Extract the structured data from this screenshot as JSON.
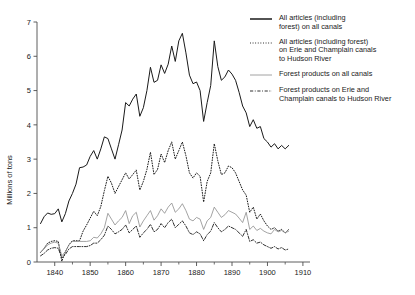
{
  "chart_data": {
    "type": "line",
    "title": "",
    "xlabel": "",
    "ylabel": "Millions of tons",
    "xlim": [
      1835,
      1912
    ],
    "ylim": [
      0,
      7
    ],
    "xticks": [
      1840,
      1850,
      1860,
      1870,
      1880,
      1890,
      1900,
      1910
    ],
    "xticklabels": [
      "1840",
      "1850",
      "1860",
      "1870",
      "1880",
      "1890",
      "1900",
      "1910"
    ],
    "xminorticks": [
      1845,
      1855,
      1865,
      1875,
      1885,
      1895,
      1905
    ],
    "yticks": [
      0,
      1,
      2,
      3,
      4,
      5,
      6,
      7
    ],
    "yticklabels": [
      "0",
      "1",
      "2",
      "3",
      "4",
      "5",
      "6",
      "7"
    ],
    "grid": false,
    "legend_position": "right",
    "axes_style": "left-and-bottom-spines-only",
    "series": [
      {
        "name": "All articles (including\nforest) on all canals",
        "legend_label": "All articles (including\nforest) on all canals",
        "style": "solid",
        "color": "#1a1a1a",
        "width": 1.0,
        "x": [
          1836,
          1837,
          1838,
          1839,
          1840,
          1841,
          1842,
          1843,
          1844,
          1845,
          1846,
          1847,
          1848,
          1849,
          1850,
          1851,
          1852,
          1853,
          1854,
          1855,
          1856,
          1857,
          1858,
          1859,
          1860,
          1861,
          1862,
          1863,
          1864,
          1865,
          1866,
          1867,
          1868,
          1869,
          1870,
          1871,
          1872,
          1873,
          1874,
          1875,
          1876,
          1877,
          1878,
          1879,
          1880,
          1881,
          1882,
          1883,
          1884,
          1885,
          1886,
          1887,
          1888,
          1889,
          1890,
          1891,
          1892,
          1893,
          1894,
          1895,
          1896,
          1897,
          1898,
          1899,
          1900,
          1901,
          1902,
          1903,
          1904,
          1905,
          1906
        ],
        "y": [
          1.12,
          1.32,
          1.43,
          1.39,
          1.41,
          1.55,
          1.17,
          1.41,
          1.78,
          2.0,
          2.27,
          2.75,
          2.77,
          2.83,
          3.08,
          3.25,
          3.0,
          3.3,
          3.65,
          3.6,
          3.3,
          3.0,
          3.42,
          3.85,
          4.65,
          4.55,
          4.75,
          4.9,
          4.25,
          4.5,
          5.0,
          5.68,
          5.24,
          5.3,
          5.75,
          5.5,
          5.77,
          6.3,
          5.85,
          6.45,
          6.67,
          6.1,
          5.45,
          5.2,
          5.25,
          5.0,
          4.1,
          4.65,
          5.15,
          6.45,
          5.7,
          5.3,
          5.4,
          5.6,
          5.48,
          5.3,
          4.95,
          4.55,
          4.35,
          3.95,
          4.15,
          3.9,
          3.95,
          3.6,
          3.5,
          3.35,
          3.45,
          3.3,
          3.4,
          3.3,
          3.4
        ]
      },
      {
        "name": "All articles (including forest)\non Erie and Champlain canals\nto Hudson River",
        "legend_label": "All articles (including forest)\non Erie and Champlain canals\nto Hudson River",
        "style": "dotted",
        "color": "#1a1a1a",
        "width": 1.0,
        "x": [
          1836,
          1837,
          1838,
          1839,
          1840,
          1841,
          1842,
          1843,
          1844,
          1845,
          1846,
          1847,
          1848,
          1849,
          1850,
          1851,
          1852,
          1853,
          1854,
          1855,
          1856,
          1857,
          1858,
          1859,
          1860,
          1861,
          1862,
          1863,
          1864,
          1865,
          1866,
          1867,
          1868,
          1869,
          1870,
          1871,
          1872,
          1873,
          1874,
          1875,
          1876,
          1877,
          1878,
          1879,
          1880,
          1881,
          1882,
          1883,
          1884,
          1885,
          1886,
          1887,
          1888,
          1889,
          1890,
          1891,
          1892,
          1893,
          1894,
          1895,
          1896,
          1897,
          1898,
          1899,
          1900,
          1901,
          1902,
          1903,
          1904,
          1905,
          1906
        ],
        "y": [
          0.28,
          0.4,
          0.55,
          0.6,
          0.62,
          0.6,
          0.02,
          0.3,
          0.5,
          0.62,
          0.62,
          0.62,
          0.9,
          1.08,
          1.28,
          1.48,
          1.35,
          1.62,
          2.08,
          2.5,
          2.3,
          2.0,
          2.2,
          2.4,
          2.6,
          2.42,
          2.55,
          2.68,
          2.1,
          2.35,
          2.7,
          3.2,
          2.55,
          2.7,
          3.15,
          2.9,
          3.25,
          3.5,
          3.0,
          3.25,
          3.5,
          3.1,
          2.6,
          2.45,
          2.6,
          2.5,
          1.75,
          2.35,
          2.6,
          3.45,
          2.95,
          2.55,
          2.6,
          2.8,
          2.75,
          2.6,
          2.35,
          2.1,
          1.95,
          1.45,
          1.6,
          1.25,
          1.4,
          1.2,
          1.05,
          0.95,
          1.0,
          0.9,
          0.95,
          0.85,
          0.95
        ]
      },
      {
        "name": "Forest products on all canals",
        "legend_label": "Forest products on all canals",
        "style": "solid-thin-gray",
        "color": "#8c8c8c",
        "width": 0.8,
        "x": [
          1836,
          1837,
          1838,
          1839,
          1840,
          1841,
          1842,
          1843,
          1844,
          1845,
          1846,
          1847,
          1848,
          1849,
          1850,
          1851,
          1852,
          1853,
          1854,
          1855,
          1856,
          1857,
          1858,
          1859,
          1860,
          1861,
          1862,
          1863,
          1864,
          1865,
          1866,
          1867,
          1868,
          1869,
          1870,
          1871,
          1872,
          1873,
          1874,
          1875,
          1876,
          1877,
          1878,
          1879,
          1880,
          1881,
          1882,
          1883,
          1884,
          1885,
          1886,
          1887,
          1888,
          1889,
          1890,
          1891,
          1892,
          1893,
          1894,
          1895,
          1896,
          1897,
          1898,
          1899,
          1900,
          1901,
          1902,
          1903,
          1904,
          1905,
          1906
        ],
        "y": [
          0.28,
          0.38,
          0.5,
          0.55,
          0.58,
          0.55,
          0.18,
          0.3,
          0.5,
          0.6,
          0.6,
          0.6,
          0.6,
          0.6,
          0.62,
          0.72,
          0.7,
          0.82,
          1.0,
          1.42,
          1.25,
          1.08,
          1.2,
          1.3,
          1.5,
          1.12,
          1.35,
          1.45,
          1.02,
          1.2,
          1.35,
          1.5,
          1.22,
          1.35,
          1.55,
          1.42,
          1.6,
          1.72,
          1.45,
          1.55,
          1.7,
          1.5,
          1.25,
          1.2,
          1.3,
          1.25,
          0.95,
          1.2,
          1.3,
          1.6,
          1.45,
          1.3,
          1.38,
          1.5,
          1.45,
          1.4,
          1.28,
          1.15,
          1.45,
          0.95,
          1.05,
          0.92,
          0.98,
          0.9,
          0.85,
          0.82,
          0.95,
          0.88,
          0.92,
          0.85,
          0.9
        ]
      },
      {
        "name": "Forest products on Erie and\nChamplain canals to Hudson River",
        "legend_label": "Forest products on Erie and\nChamplain canals to Hudson River",
        "style": "dashdot",
        "color": "#1a1a1a",
        "width": 0.9,
        "x": [
          1836,
          1837,
          1838,
          1839,
          1840,
          1841,
          1842,
          1843,
          1844,
          1845,
          1846,
          1847,
          1848,
          1849,
          1850,
          1851,
          1852,
          1853,
          1854,
          1855,
          1856,
          1857,
          1858,
          1859,
          1860,
          1861,
          1862,
          1863,
          1864,
          1865,
          1866,
          1867,
          1868,
          1869,
          1870,
          1871,
          1872,
          1873,
          1874,
          1875,
          1876,
          1877,
          1878,
          1879,
          1880,
          1881,
          1882,
          1883,
          1884,
          1885,
          1886,
          1887,
          1888,
          1889,
          1890,
          1891,
          1892,
          1893,
          1894,
          1895,
          1896,
          1897,
          1898,
          1899,
          1900,
          1901,
          1902,
          1903,
          1904,
          1905,
          1906
        ],
        "y": [
          0.18,
          0.25,
          0.35,
          0.4,
          0.42,
          0.4,
          0.12,
          0.22,
          0.38,
          0.45,
          0.45,
          0.45,
          0.45,
          0.45,
          0.48,
          0.55,
          0.55,
          0.65,
          0.78,
          1.05,
          0.95,
          0.82,
          0.88,
          0.95,
          1.08,
          0.85,
          0.95,
          1.05,
          0.72,
          0.85,
          0.95,
          1.1,
          0.88,
          0.95,
          1.12,
          1.0,
          1.15,
          1.25,
          1.0,
          1.1,
          1.2,
          1.05,
          0.85,
          0.8,
          0.88,
          0.82,
          0.62,
          0.8,
          0.9,
          1.15,
          1.0,
          0.88,
          0.95,
          1.05,
          1.0,
          0.95,
          0.85,
          0.75,
          0.95,
          0.6,
          0.65,
          0.55,
          0.58,
          0.5,
          0.45,
          0.4,
          0.45,
          0.38,
          0.42,
          0.35,
          0.38
        ]
      }
    ]
  },
  "legend": {
    "entries": [
      {
        "label": "All articles (including\nforest) on all canals",
        "style": "solid"
      },
      {
        "label": "All articles (including forest)\non Erie and Champlain canals\nto Hudson River",
        "style": "dotted"
      },
      {
        "label": "Forest products on all canals",
        "style": "solid-thin-gray"
      },
      {
        "label": "Forest products on Erie and\nChamplain canals to Hudson River",
        "style": "dashdot"
      }
    ]
  },
  "colors": {
    "ink": "#1a1a1a",
    "gray_series": "#8c8c8c",
    "background": "#ffffff"
  }
}
